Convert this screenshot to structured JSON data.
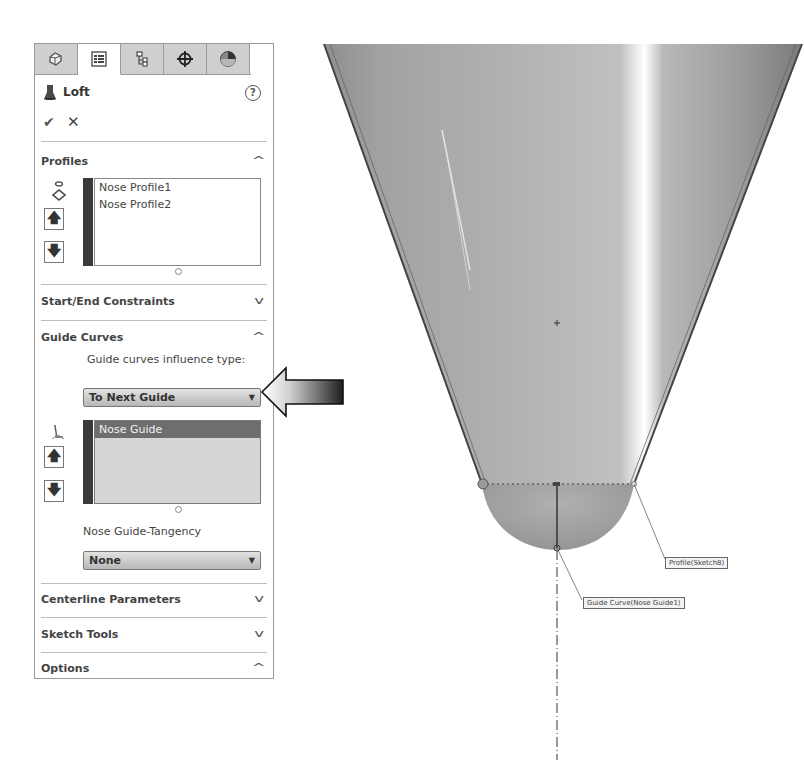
{
  "panel": {
    "tabs": [
      {
        "name": "featuremanager-tab",
        "icon": "feature-tree-icon",
        "active": false
      },
      {
        "name": "propertymanager-tab",
        "icon": "property-list-icon",
        "active": true
      },
      {
        "name": "configurationmanager-tab",
        "icon": "configuration-icon",
        "active": false
      },
      {
        "name": "dimxpert-tab",
        "icon": "crosshair-icon",
        "active": false
      },
      {
        "name": "display-manager-tab",
        "icon": "appearance-sphere-icon",
        "active": false
      }
    ],
    "title": "Loft",
    "help_glyph": "?",
    "ok_glyph": "✔",
    "cancel_glyph": "✕",
    "profiles": {
      "title": "Profiles",
      "chevron": "^",
      "items": [
        "Nose Profile1",
        "Nose Profile2"
      ],
      "move_up_glyph": "🡅",
      "move_down_glyph": "🡇"
    },
    "start_end_constraints": {
      "title": "Start/End Constraints",
      "chevron": "v"
    },
    "guide_curves": {
      "title": "Guide Curves",
      "chevron": "^",
      "influence_label": "Guide curves influence type:",
      "influence_value": "To Next Guide",
      "items": [
        "Nose Guide"
      ],
      "selected_item": "Nose Guide",
      "tangency_label": "Nose Guide-Tangency",
      "tangency_value": "None"
    },
    "centerline_parameters": {
      "title": "Centerline Parameters",
      "chevron": "v"
    },
    "sketch_tools": {
      "title": "Sketch Tools",
      "chevron": "v"
    },
    "options": {
      "title": "Options",
      "chevron": "^"
    }
  },
  "viewport": {
    "callouts": {
      "profile": "Profile(Sketch8)",
      "guide_curve": "Guide Curve(Nose Guide1)"
    }
  },
  "colors": {
    "tab_inactive": "#cfcfcf",
    "list_bar": "#3a3a3a",
    "selected_row": "#6e6e6e",
    "model_gray": "#a8a8a8"
  }
}
